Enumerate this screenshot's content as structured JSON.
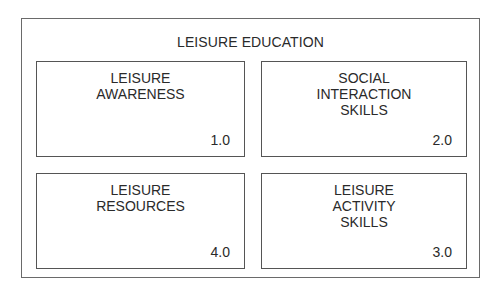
{
  "diagram": {
    "title": "LEISURE EDUCATION",
    "components": [
      {
        "label": "LEISURE\nAWARENESS",
        "number": "1.0"
      },
      {
        "label": "SOCIAL\nINTERACTION\nSKILLS",
        "number": "2.0"
      },
      {
        "label": "LEISURE\nRESOURCES",
        "number": "4.0"
      },
      {
        "label": "LEISURE\nACTIVITY\nSKILLS",
        "number": "3.0"
      }
    ]
  }
}
